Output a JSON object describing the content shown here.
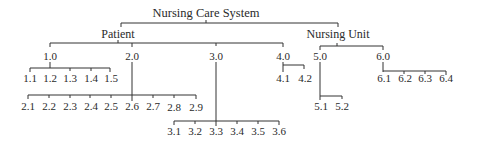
{
  "title": "Nursing Care System",
  "colors": {
    "line": "#333333",
    "text": "#2a2a2a",
    "background": "#ffffff"
  },
  "groups": [
    {
      "name": "Patient",
      "nodes": [
        {
          "id": "1.0",
          "children": [
            "1.1",
            "1.2",
            "1.3",
            "1.4",
            "1.5"
          ]
        },
        {
          "id": "2.0",
          "children": [
            "2.1",
            "2.2",
            "2.3",
            "2.4",
            "2.5",
            "2.6",
            "2.7",
            "2.8",
            "2.9"
          ]
        },
        {
          "id": "3.0",
          "children": [
            "3.1",
            "3.2",
            "3.3",
            "3.4",
            "3.5",
            "3.6"
          ]
        },
        {
          "id": "4.0",
          "children": [
            "4.1",
            "4.2"
          ]
        }
      ]
    },
    {
      "name": "Nursing Unit",
      "nodes": [
        {
          "id": "5.0",
          "children": [
            "5.1",
            "5.2"
          ]
        },
        {
          "id": "6.0",
          "children": [
            "6.1",
            "6.2",
            "6.3",
            "6.4"
          ]
        }
      ]
    }
  ]
}
